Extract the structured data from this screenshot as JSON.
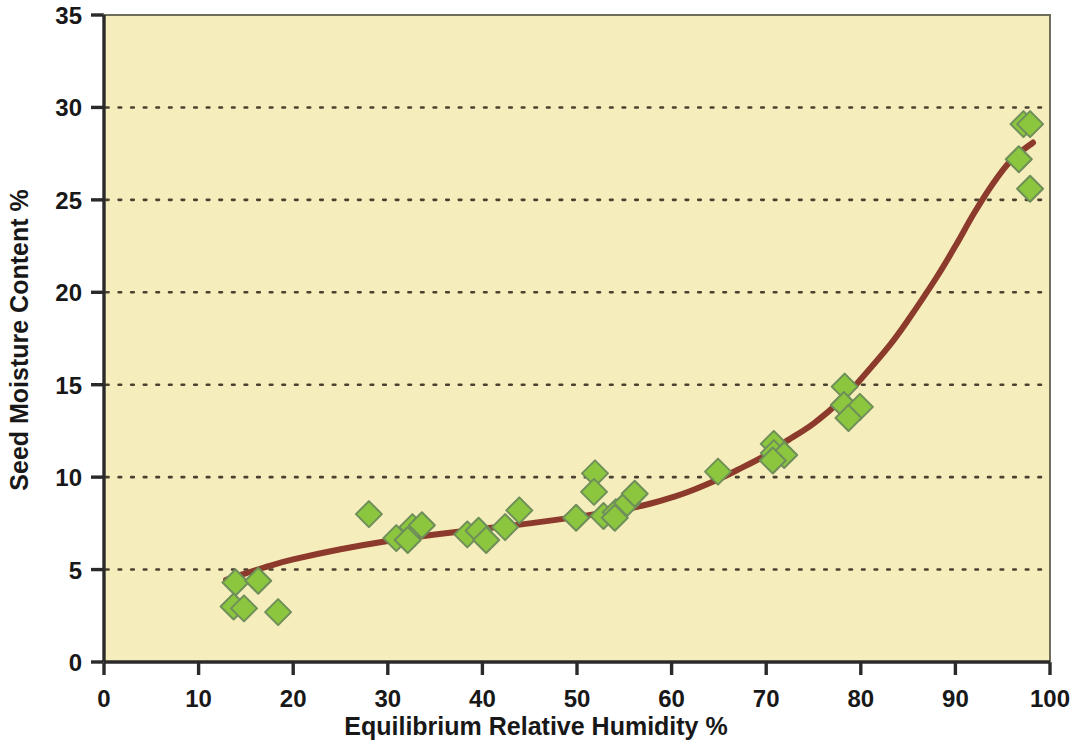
{
  "chart_data": {
    "type": "scatter",
    "title": "",
    "xlabel": "Equilibrium Relative Humidity %",
    "ylabel": "Seed Moisture Content %",
    "xlim": [
      0,
      100
    ],
    "ylim": [
      0,
      35
    ],
    "xticks": [
      0,
      10,
      20,
      30,
      40,
      50,
      60,
      70,
      80,
      90,
      100
    ],
    "yticks": [
      0,
      5,
      10,
      15,
      20,
      25,
      30,
      35
    ],
    "xtick_labels": [
      "0",
      "10",
      "20",
      "30",
      "40",
      "50",
      "60",
      "70",
      "80",
      "90",
      "100"
    ],
    "ytick_labels": [
      "0",
      "5",
      "10",
      "15",
      "20",
      "25",
      "30",
      "35"
    ],
    "grid": "horizontal-dotted",
    "legend": "none",
    "plot_background": "#F6EDBC",
    "plot_border_color": "#6E6E5A",
    "marker_fill": "#8CC63F",
    "marker_edge": "#6F8F5A",
    "marker_shape": "diamond",
    "marker_size": 13,
    "curve_color": "#8C3A2B",
    "curve_width": 6,
    "series": [
      {
        "name": "Seed moisture vs ERH",
        "points": [
          [
            13.9,
            4.3
          ],
          [
            13.7,
            3.0
          ],
          [
            14.8,
            2.9
          ],
          [
            16.3,
            4.4
          ],
          [
            18.4,
            2.7
          ],
          [
            28.0,
            8.0
          ],
          [
            30.9,
            6.7
          ],
          [
            32.6,
            7.3
          ],
          [
            32.1,
            6.6
          ],
          [
            33.6,
            7.4
          ],
          [
            38.4,
            6.9
          ],
          [
            39.6,
            7.1
          ],
          [
            40.4,
            6.6
          ],
          [
            42.4,
            7.3
          ],
          [
            43.9,
            8.2
          ],
          [
            49.9,
            7.8
          ],
          [
            51.9,
            10.2
          ],
          [
            51.8,
            9.2
          ],
          [
            52.8,
            7.9
          ],
          [
            54.1,
            8.1
          ],
          [
            54.0,
            7.8
          ],
          [
            55.3,
            8.6
          ],
          [
            56.1,
            9.1
          ],
          [
            64.9,
            10.3
          ],
          [
            70.8,
            11.8
          ],
          [
            70.8,
            11.3
          ],
          [
            71.9,
            11.2
          ],
          [
            70.7,
            10.9
          ],
          [
            78.3,
            14.9
          ],
          [
            78.2,
            13.9
          ],
          [
            79.9,
            13.8
          ],
          [
            78.7,
            13.2
          ],
          [
            97.2,
            29.1
          ],
          [
            97.9,
            29.1
          ],
          [
            96.7,
            27.2
          ],
          [
            97.9,
            25.6
          ]
        ]
      }
    ],
    "fitted_curve": {
      "name": "fitted sorption isotherm",
      "points": [
        [
          12.9,
          4.45
        ],
        [
          15,
          4.8
        ],
        [
          17.5,
          5.2
        ],
        [
          20,
          5.55
        ],
        [
          25,
          6.1
        ],
        [
          30,
          6.55
        ],
        [
          35,
          6.9
        ],
        [
          40,
          7.2
        ],
        [
          45,
          7.5
        ],
        [
          50,
          7.85
        ],
        [
          55,
          8.25
        ],
        [
          58,
          8.6
        ],
        [
          60,
          8.9
        ],
        [
          62,
          9.25
        ],
        [
          65,
          9.9
        ],
        [
          67,
          10.4
        ],
        [
          70,
          11.2
        ],
        [
          72,
          11.9
        ],
        [
          75,
          12.9
        ],
        [
          78,
          14.2
        ],
        [
          80,
          15.3
        ],
        [
          83,
          17.1
        ],
        [
          85,
          18.5
        ],
        [
          88,
          20.8
        ],
        [
          90,
          22.5
        ],
        [
          92,
          24.3
        ],
        [
          94,
          25.9
        ],
        [
          96,
          27.2
        ],
        [
          98.2,
          28.1
        ]
      ]
    }
  }
}
